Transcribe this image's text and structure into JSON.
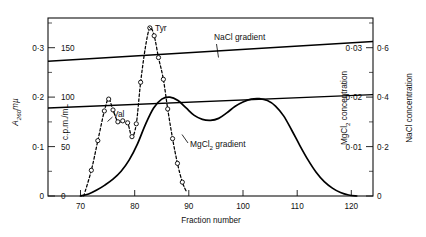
{
  "chart_data": {
    "type": "line",
    "title": "",
    "xlabel": "Fraction number",
    "xlim": [
      64,
      124
    ],
    "x_ticks": [
      70,
      80,
      90,
      100,
      110,
      120
    ],
    "x_tick_labels": [
      "70",
      "80",
      "90",
      "100",
      "110",
      "120"
    ],
    "grid": false,
    "legend_position": "inline-annotations",
    "axes": {
      "left_outer": {
        "label": "A",
        "label_sub": "260",
        "label_suffix": "mµ",
        "label_full": "A260mµ",
        "ticks": [
          0,
          0.1,
          0.2,
          0.3
        ],
        "tick_labels": [
          "0",
          "0·1",
          "0·2",
          "0·3"
        ],
        "range": [
          0,
          0.36
        ]
      },
      "left_inner": {
        "label_full": "c.p.m./mL",
        "ticks": [
          0,
          50,
          100,
          150
        ],
        "tick_labels": [
          "0",
          "50",
          "100",
          "150"
        ],
        "range": [
          0,
          180
        ]
      },
      "right_inner": {
        "label": "MgCl",
        "label_sub": "2",
        "label_suffix": " concentration",
        "label_full": "MgCl2 concentration",
        "ticks": [
          0.01,
          0.02,
          0.03
        ],
        "tick_labels": [
          "0·01",
          "0·02",
          "0·03"
        ],
        "range": [
          0,
          0.036
        ]
      },
      "right_outer": {
        "label_full": "NaCl concentration",
        "ticks": [
          0,
          0.2,
          0.4,
          0.6
        ],
        "tick_labels": [
          "0",
          "0·2",
          "0·4",
          "0·6"
        ],
        "range": [
          0,
          0.72
        ]
      }
    },
    "annotations": [
      {
        "id": "val-label",
        "text": "Val",
        "x": 76.2,
        "y_axis": "left_inner",
        "y": 118
      },
      {
        "id": "tyr-label",
        "text": "Tyr",
        "x": 84.6,
        "y_axis": "left_inner",
        "y": 175
      },
      {
        "id": "nacl-gradient-label",
        "text": "NaCl gradient",
        "x": 93.5,
        "y_axis": "right_outer",
        "y": 0.66
      },
      {
        "id": "mgcl2-gradient-label",
        "text": "MgCl",
        "text_sub": "2",
        "text_suffix": " gradient",
        "text_full": "MgCl2 gradient",
        "x": 90.0,
        "y_axis": "right_inner",
        "y": 0.0158
      }
    ],
    "series": [
      {
        "name": "A260 absorbance",
        "style": "solid",
        "axis": "left_outer",
        "markers": false,
        "points": [
          [
            70.0,
            0.0
          ],
          [
            71.5,
            0.004
          ],
          [
            73.0,
            0.012
          ],
          [
            74.5,
            0.022
          ],
          [
            76.0,
            0.034
          ],
          [
            77.5,
            0.05
          ],
          [
            79.0,
            0.073
          ],
          [
            80.5,
            0.105
          ],
          [
            82.0,
            0.145
          ],
          [
            83.5,
            0.178
          ],
          [
            85.0,
            0.196
          ],
          [
            86.5,
            0.2
          ],
          [
            88.0,
            0.193
          ],
          [
            89.5,
            0.178
          ],
          [
            91.0,
            0.163
          ],
          [
            92.5,
            0.155
          ],
          [
            94.0,
            0.153
          ],
          [
            95.5,
            0.157
          ],
          [
            97.0,
            0.168
          ],
          [
            98.5,
            0.181
          ],
          [
            100.0,
            0.19
          ],
          [
            101.5,
            0.196
          ],
          [
            103.0,
            0.197
          ],
          [
            104.5,
            0.193
          ],
          [
            106.0,
            0.182
          ],
          [
            107.5,
            0.162
          ],
          [
            109.0,
            0.133
          ],
          [
            110.5,
            0.102
          ],
          [
            112.0,
            0.073
          ],
          [
            113.5,
            0.048
          ],
          [
            115.0,
            0.029
          ],
          [
            116.5,
            0.016
          ],
          [
            118.0,
            0.007
          ],
          [
            119.5,
            0.002
          ],
          [
            121.0,
            0.0
          ]
        ]
      },
      {
        "name": "Radioactivity (c.p.m./mL)",
        "style": "dashed",
        "axis": "left_inner",
        "markers": true,
        "points": [
          [
            70.6,
            0.0
          ],
          [
            72.0,
            26.0
          ],
          [
            73.2,
            56.0
          ],
          [
            74.4,
            86.0
          ],
          [
            75.2,
            98.0
          ],
          [
            76.0,
            87.0
          ],
          [
            76.9,
            75.0
          ],
          [
            77.8,
            76.0
          ],
          [
            78.7,
            74.0
          ],
          [
            79.5,
            60.0
          ],
          [
            80.3,
            73.0
          ],
          [
            81.1,
            115.0
          ],
          [
            82.0,
            151.0
          ],
          [
            82.8,
            170.0
          ],
          [
            83.6,
            162.0
          ],
          [
            84.4,
            140.0
          ],
          [
            85.3,
            118.0
          ],
          [
            86.1,
            88.0
          ],
          [
            87.0,
            58.0
          ],
          [
            87.9,
            33.0
          ],
          [
            88.8,
            14.0
          ],
          [
            89.6,
            4.0
          ]
        ],
        "marker_points": [
          [
            72.0,
            26.0
          ],
          [
            73.2,
            56.0
          ],
          [
            74.4,
            86.0
          ],
          [
            75.2,
            98.0
          ],
          [
            76.0,
            87.0
          ],
          [
            76.9,
            75.0
          ],
          [
            77.8,
            76.0
          ],
          [
            78.7,
            74.0
          ],
          [
            79.5,
            60.0
          ],
          [
            80.3,
            73.0
          ],
          [
            81.1,
            115.0
          ],
          [
            82.8,
            170.0
          ],
          [
            83.6,
            162.0
          ],
          [
            84.4,
            140.0
          ],
          [
            85.3,
            118.0
          ],
          [
            86.1,
            88.0
          ],
          [
            87.0,
            58.0
          ],
          [
            87.9,
            33.0
          ],
          [
            88.8,
            14.0
          ]
        ]
      },
      {
        "name": "NaCl gradient",
        "style": "solid-thin",
        "axis": "right_outer",
        "markers": false,
        "points": [
          [
            64.0,
            0.545
          ],
          [
            124.0,
            0.625
          ]
        ]
      },
      {
        "name": "MgCl2 gradient",
        "style": "solid-thin",
        "axis": "right_inner",
        "markers": false,
        "points": [
          [
            64.0,
            0.0178
          ],
          [
            124.0,
            0.0205
          ]
        ]
      }
    ]
  }
}
